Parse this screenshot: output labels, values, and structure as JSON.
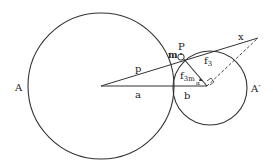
{
  "diagram": {
    "circles": [
      {
        "id": "A",
        "label": "A",
        "cx": 101,
        "cy": 86,
        "r": 73
      },
      {
        "id": "A_prime",
        "label": "A′",
        "cx": 210,
        "cy": 88,
        "r": 37
      }
    ],
    "labels": {
      "A": "A",
      "A_prime": "A′",
      "a": "a",
      "b": "b",
      "p": "p",
      "x": "x",
      "m": "m",
      "P": "P",
      "f3": "f",
      "f3_sub": "3",
      "f3m": "f",
      "f3m_sub": "3m",
      "alpha": "α"
    },
    "colors": {
      "stroke": "#333333",
      "text": "#222222"
    }
  }
}
